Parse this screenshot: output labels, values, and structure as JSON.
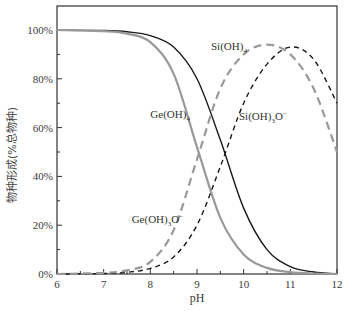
{
  "chart_data": {
    "type": "line",
    "title": "",
    "xlabel": "pH",
    "ylabel": "物种形成(%总物种)",
    "xlim": [
      6,
      12
    ],
    "ylim": [
      0,
      110
    ],
    "x_ticks": [
      6,
      7,
      8,
      9,
      10,
      11,
      12
    ],
    "y_ticks": [
      0,
      20,
      40,
      60,
      80,
      100
    ],
    "y_tick_labels": [
      "0%",
      "20%",
      "40%",
      "60%",
      "80%",
      "100%"
    ],
    "x_tick_labels": [
      "6",
      "7",
      "8",
      "9",
      "10",
      "11",
      "12"
    ],
    "grid": false,
    "legend": "inline labels",
    "series": [
      {
        "name": "Si(OH)4",
        "label_main": "Si(OH)",
        "label_sub": "4",
        "label_sup": "",
        "style": "solid",
        "color": "#1a1a1a",
        "x": [
          6,
          7,
          7.5,
          8,
          8.5,
          9,
          9.5,
          10,
          10.5,
          11,
          11.5,
          12
        ],
        "values": [
          100,
          99.8,
          99.3,
          97.7,
          93,
          80,
          55,
          27,
          10,
          3,
          0.8,
          0
        ]
      },
      {
        "name": "Ge(OH)4",
        "label_main": "Ge(OH)",
        "label_sub": "4",
        "label_sup": "",
        "style": "solid",
        "color": "#999999",
        "x": [
          6,
          7,
          7.5,
          8,
          8.5,
          9,
          9.5,
          10,
          10.5,
          11,
          11.5,
          12
        ],
        "values": [
          100,
          99.5,
          98.5,
          95,
          82,
          52,
          23,
          8,
          2.5,
          0.8,
          0.2,
          0
        ]
      },
      {
        "name": "Si(OH)3O−",
        "label_main": "Si(OH)",
        "label_sub": "3",
        "label_sup": "O−",
        "style": "dashed",
        "color": "#1a1a1a",
        "x": [
          6,
          7,
          7.5,
          8,
          8.5,
          9,
          9.5,
          10,
          10.5,
          11,
          11.5,
          12
        ],
        "values": [
          0,
          0.2,
          0.7,
          2.3,
          7,
          20,
          44,
          70,
          86,
          93,
          88,
          70
        ]
      },
      {
        "name": "Ge(OH)3O−",
        "label_main": "Ge(OH)",
        "label_sub": "3",
        "label_sup": "O−",
        "style": "dashed",
        "color": "#999999",
        "x": [
          6,
          7,
          7.5,
          8,
          8.5,
          9,
          9.5,
          10,
          10.5,
          11,
          11.5,
          12
        ],
        "values": [
          0,
          0.5,
          1.5,
          5,
          18,
          47,
          76,
          90,
          94,
          90,
          76,
          50
        ]
      }
    ],
    "annotations": [
      {
        "text": "Si(OH)4",
        "x": 9.3,
        "y": 92
      },
      {
        "text": "Ge(OH)4",
        "x": 8.0,
        "y": 64
      },
      {
        "text": "Si(OH)3O−",
        "x": 9.9,
        "y": 63
      },
      {
        "text": "Ge(OH)3O−",
        "x": 7.6,
        "y": 21
      }
    ]
  }
}
